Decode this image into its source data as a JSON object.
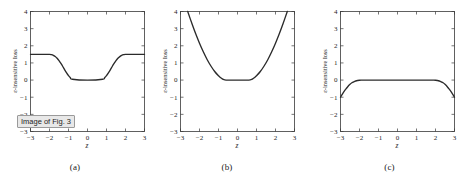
{
  "figure": {
    "background": "#ffffff",
    "curve_color": "#2b2b2b",
    "axis_color": "#3a3a3a",
    "panels": [
      {
        "id": "a",
        "caption": "(a)",
        "xlabel": "z",
        "ylabel": "ε-insensitive loss",
        "xticks": [
          "-3",
          "-2",
          "-1",
          "0",
          "1",
          "2",
          "3"
        ],
        "yticks": [
          "-3",
          "-2",
          "-1",
          "0",
          "1",
          "2",
          "3",
          "4"
        ]
      },
      {
        "id": "b",
        "caption": "(b)",
        "xlabel": "z",
        "ylabel": "ε-insensitive loss",
        "xticks": [
          "-3",
          "-2",
          "-1",
          "0",
          "1",
          "2",
          "3"
        ],
        "yticks": [
          "-3",
          "-2",
          "-1",
          "0",
          "1",
          "2",
          "3",
          "4"
        ]
      },
      {
        "id": "c",
        "caption": "(c)",
        "xlabel": "z",
        "ylabel": "ε-insensitive loss",
        "xticks": [
          "-3",
          "-2",
          "-1",
          "0",
          "1",
          "2",
          "3"
        ],
        "yticks": [
          "-3",
          "-2",
          "-1",
          "0",
          "1",
          "2",
          "3",
          "4"
        ]
      }
    ]
  },
  "tooltip": {
    "label": "Image of Fig. 3"
  },
  "chart_data": [
    {
      "type": "line",
      "id": "a",
      "title": "",
      "xlabel": "z",
      "ylabel": "ε-insensitive loss",
      "xlim": [
        -3,
        3
      ],
      "ylim": [
        -3,
        4
      ],
      "xticks": [
        -3,
        -2,
        -1,
        0,
        1,
        2,
        3
      ],
      "yticks": [
        -3,
        -2,
        -1,
        0,
        1,
        2,
        3,
        4
      ],
      "grid": false,
      "legend": null,
      "series": [
        {
          "name": "epsilon-insensitive loss (saturating)",
          "x": [
            -3.0,
            -2.6,
            -2.2,
            -2.0,
            -1.9,
            -1.8,
            -1.7,
            -1.6,
            -1.5,
            -1.4,
            -1.3,
            -1.2,
            -1.1,
            -1.0,
            -0.9,
            -0.8,
            0.0,
            0.8,
            0.9,
            1.0,
            1.1,
            1.2,
            1.3,
            1.4,
            1.5,
            1.6,
            1.7,
            1.8,
            1.9,
            2.0,
            2.2,
            2.6,
            3.0
          ],
          "y": [
            1.5,
            1.5,
            1.5,
            1.5,
            1.48,
            1.44,
            1.37,
            1.27,
            1.13,
            0.97,
            0.79,
            0.6,
            0.42,
            0.26,
            0.14,
            0.05,
            0.0,
            0.05,
            0.14,
            0.26,
            0.42,
            0.6,
            0.79,
            0.97,
            1.13,
            1.27,
            1.37,
            1.44,
            1.48,
            1.5,
            1.5,
            1.5,
            1.5
          ]
        }
      ]
    },
    {
      "type": "line",
      "id": "b",
      "title": "",
      "xlabel": "z",
      "ylabel": "ε-insensitive loss",
      "xlim": [
        -3,
        3
      ],
      "ylim": [
        -3,
        4
      ],
      "xticks": [
        -3,
        -2,
        -1,
        0,
        1,
        2,
        3
      ],
      "yticks": [
        -3,
        -2,
        -1,
        0,
        1,
        2,
        3,
        4
      ],
      "grid": false,
      "legend": null,
      "series": [
        {
          "name": "quadratic epsilon-insensitive loss",
          "x": [
            -2.62,
            -2.4,
            -2.2,
            -2.0,
            -1.8,
            -1.6,
            -1.4,
            -1.2,
            -1.0,
            -0.9,
            -0.8,
            -0.7,
            -0.6,
            0.0,
            0.6,
            0.7,
            0.8,
            0.9,
            1.0,
            1.2,
            1.4,
            1.6,
            1.8,
            2.0,
            2.2,
            2.4,
            2.62
          ],
          "y": [
            4.0,
            3.3,
            2.7,
            2.15,
            1.65,
            1.2,
            0.82,
            0.5,
            0.25,
            0.15,
            0.07,
            0.02,
            0.0,
            0.0,
            0.0,
            0.02,
            0.07,
            0.15,
            0.25,
            0.5,
            0.82,
            1.2,
            1.65,
            2.15,
            2.7,
            3.3,
            4.0
          ]
        }
      ]
    },
    {
      "type": "line",
      "id": "c",
      "title": "",
      "xlabel": "z",
      "ylabel": "ε-insensitive loss",
      "xlim": [
        -3,
        3
      ],
      "ylim": [
        -3,
        4
      ],
      "xticks": [
        -3,
        -2,
        -1,
        0,
        1,
        2,
        3
      ],
      "yticks": [
        -3,
        -2,
        -1,
        0,
        1,
        2,
        3,
        4
      ],
      "grid": false,
      "legend": null,
      "series": [
        {
          "name": "inverted saturating loss",
          "x": [
            -3.0,
            -2.9,
            -2.8,
            -2.7,
            -2.6,
            -2.5,
            -2.4,
            -2.3,
            -2.2,
            -2.1,
            -2.0,
            -1.9,
            -1.8,
            0.0,
            1.8,
            1.9,
            2.0,
            2.1,
            2.2,
            2.3,
            2.4,
            2.5,
            2.6,
            2.7,
            2.8,
            2.9,
            3.0
          ],
          "y": [
            -1.0,
            -0.82,
            -0.65,
            -0.5,
            -0.36,
            -0.25,
            -0.16,
            -0.1,
            -0.055,
            -0.025,
            -0.008,
            -0.002,
            0.0,
            0.0,
            0.0,
            -0.002,
            -0.008,
            -0.025,
            -0.055,
            -0.1,
            -0.16,
            -0.25,
            -0.36,
            -0.5,
            -0.65,
            -0.82,
            -1.0
          ]
        }
      ]
    }
  ]
}
